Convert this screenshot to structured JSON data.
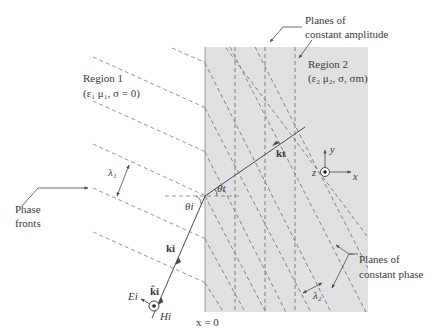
{
  "diagram": {
    "type": "oblique-incidence-on-lossy-medium",
    "colors": {
      "region2_fill": "#dfe1e3",
      "line": "#4a4a4a",
      "dashed": "#8a8a8a",
      "text": "#3a3a3a"
    },
    "labels": {
      "region1_title": "Region 1",
      "region1_params": "(ε₁ μ₁, σ = 0)",
      "region2_title": "Region 2",
      "region2_params": "(ε₂ μ₂, σ, σm)",
      "planes_amplitude_line1": "Planes of",
      "planes_amplitude_line2": "constant amplitude",
      "planes_phase_line1": "Planes of",
      "planes_phase_line2": "constant phase",
      "phase_fronts_line1": "Phase",
      "phase_fronts_line2": "fronts",
      "lambda1": "λ₁",
      "lambda2": "λ₂",
      "theta_i": "θi",
      "theta_t": "θt",
      "k_i": "ki",
      "k_i_hat": "k̂i",
      "k_t": "kt",
      "E_i": "Ei",
      "H_i": "Hi",
      "x_equals_0": "x = 0",
      "axis_x": "x",
      "axis_y": "y",
      "axis_z": "z"
    }
  }
}
